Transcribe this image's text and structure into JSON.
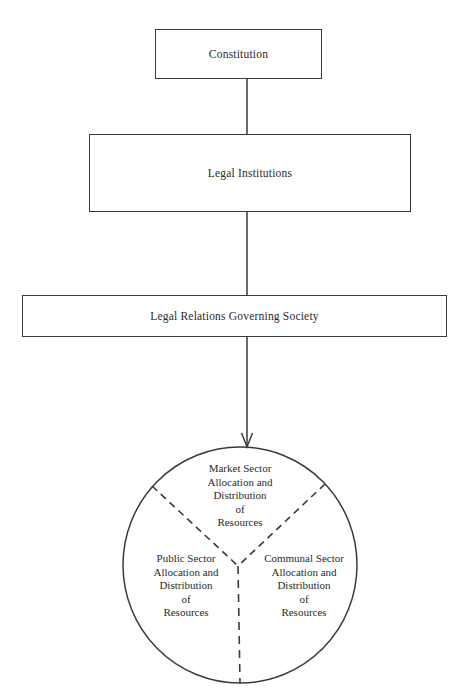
{
  "diagram": {
    "nodes": [
      {
        "id": "constitution",
        "label": "Constitution",
        "shape": "rectangle"
      },
      {
        "id": "legal_institutions",
        "label": "Legal Institutions",
        "shape": "rectangle"
      },
      {
        "id": "legal_relations",
        "label": "Legal Relations Governing Society",
        "shape": "rectangle"
      },
      {
        "id": "resource_circle",
        "label": "",
        "shape": "circle"
      }
    ],
    "edges": [
      {
        "from": "constitution",
        "to": "legal_institutions",
        "style": "solid",
        "arrow": false
      },
      {
        "from": "legal_institutions",
        "to": "legal_relations",
        "style": "solid",
        "arrow": false
      },
      {
        "from": "legal_relations",
        "to": "resource_circle",
        "style": "solid",
        "arrow": true
      }
    ],
    "circle_sectors": {
      "divider_style": "dashed",
      "market": {
        "lines": [
          "Market Sector",
          "Allocation and",
          "Distribution",
          "of",
          "Resources"
        ]
      },
      "public": {
        "lines": [
          "Public Sector",
          "Allocation and",
          "Distribution",
          "of",
          "Resources"
        ]
      },
      "communal": {
        "lines": [
          "Communal Sector",
          "Allocation and",
          "Distribution",
          "of",
          "Resources"
        ]
      }
    }
  },
  "colors": {
    "stroke": "#3a3a3a",
    "text": "#2a2a2a",
    "background": "#ffffff"
  }
}
